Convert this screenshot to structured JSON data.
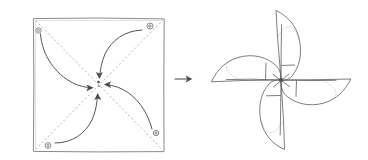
{
  "figure": {
    "title": "Pinwheel folding construction sketch",
    "medium": "pencil line drawing",
    "background_color": "#ffffff",
    "ink_color": "#555155",
    "dotted_color": "#a9a5a9",
    "width": 368,
    "height": 160,
    "panel_count": 2
  },
  "panels": [
    {
      "id": "panel-left",
      "name": "square-sheet-with-fold-arrows",
      "label": "",
      "description": "Square sheet of paper with four punched corner holes, two dotted diagonals, and four curved arrows sweeping each corner toward the centre point"
    },
    {
      "id": "panel-right",
      "name": "assembled-pinwheel",
      "label": "",
      "description": "Finished four-bladed pinwheel, each blade a curved sail meeting at a central hub"
    }
  ],
  "transition": {
    "name": "transition-arrow",
    "glyph": "→",
    "direction": "right",
    "label": ""
  },
  "square": {
    "name": "paper-square",
    "x": 33,
    "y": 18,
    "width": 131,
    "height": 134,
    "stroke": "#6e6a6e",
    "corner_labels": [
      "top-left",
      "top-right",
      "bottom-right",
      "bottom-left"
    ]
  },
  "holes": [
    {
      "name": "hole-top-left",
      "cx": 38.5,
      "cy": 30.5,
      "r": 2.6
    },
    {
      "name": "hole-top-right",
      "cx": 150.0,
      "cy": 26.0,
      "r": 2.9
    },
    {
      "name": "hole-bottom-right",
      "cx": 156.0,
      "cy": 133.0,
      "r": 2.6
    },
    {
      "name": "hole-bottom-left",
      "cx": 48.0,
      "cy": 145.5,
      "r": 2.8
    }
  ],
  "diagonals": [
    {
      "name": "diagonal-tl-br",
      "x1": 36,
      "y1": 21,
      "x2": 162,
      "y2": 149
    },
    {
      "name": "diagonal-bl-tr",
      "x1": 36,
      "y1": 149,
      "x2": 162,
      "y2": 21
    }
  ],
  "fold_arrows": [
    {
      "name": "fold-arrow-from-top-left",
      "from": "top-left",
      "to": "center",
      "head_angle_deg": 5
    },
    {
      "name": "fold-arrow-from-top-right",
      "from": "top-right",
      "to": "center",
      "head_angle_deg": 118
    },
    {
      "name": "fold-arrow-from-bottom-right",
      "from": "bottom-right",
      "to": "center",
      "head_angle_deg": 186
    },
    {
      "name": "fold-arrow-from-bottom-left",
      "from": "bottom-left",
      "to": "center",
      "head_angle_deg": 288
    }
  ],
  "center_point": {
    "name": "square-center-dot",
    "cx": 98.5,
    "cy": 82.0,
    "r": 1.2
  },
  "pinwheel": {
    "name": "pinwheel",
    "hub": {
      "cx": 281.0,
      "cy": 80.0,
      "r": 1.9
    },
    "blade_count": 4,
    "blades": [
      {
        "name": "blade-top",
        "tip_x": 276,
        "tip_y": 10,
        "orientation": "up"
      },
      {
        "name": "blade-right",
        "tip_x": 351,
        "tip_y": 80,
        "orientation": "right"
      },
      {
        "name": "blade-bottom",
        "tip_x": 284,
        "tip_y": 150,
        "orientation": "down"
      },
      {
        "name": "blade-left",
        "tip_x": 211,
        "tip_y": 82,
        "orientation": "left"
      }
    ]
  }
}
